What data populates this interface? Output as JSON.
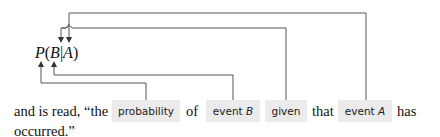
{
  "formula": {
    "function": "P",
    "open_paren": "(",
    "event": "B",
    "bar": "|",
    "condition": "A",
    "close_paren": ")"
  },
  "sentence": {
    "prefix": "and is read, “the",
    "chips": [
      {
        "id": "probability",
        "label": "probability",
        "italic_part": ""
      },
      {
        "id": "event-b",
        "label": "event ",
        "italic_part": "B"
      },
      {
        "id": "given",
        "label": "given",
        "italic_part": ""
      },
      {
        "id": "event-a",
        "label": "event ",
        "italic_part": "A"
      }
    ],
    "connector_of": "of",
    "connector_that": "that",
    "suffix": "has",
    "line2": "occurred.”"
  },
  "connectors": [
    {
      "from": "P",
      "to": "probability"
    },
    {
      "from": "B",
      "to": "event-b"
    },
    {
      "from": "given",
      "to": "bar"
    },
    {
      "from": "event-a",
      "to": "A"
    }
  ],
  "colors": {
    "chip_background": "#ebebeb",
    "line": "#555555",
    "text": "#111111"
  }
}
